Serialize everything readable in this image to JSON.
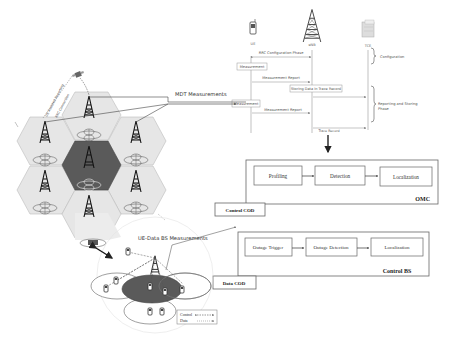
{
  "sequence": {
    "actors": {
      "ue": "UE",
      "enb": "eNB",
      "tce": "TCE"
    },
    "messages": {
      "rrc_config": "RRC Configuration Phase",
      "measurement_1": "Measurement",
      "report_1": "Measurement Report",
      "storing": "Storing Data in Trace Record",
      "measurement_2": "Measurement",
      "report_2": "Measurement Report",
      "trace_record": "Trace Record"
    },
    "phases": {
      "configuration": "Configuration",
      "reporting_line1": "Reporting and Storing",
      "reporting_line2": "Phase"
    }
  },
  "labels": {
    "mdt_measurements": "MDT Measurements",
    "ue_data_bs": "UE-Data BS Measurements",
    "ue_assisted": "UE Assisted Reporting",
    "rrc_connection": "RRC Connection"
  },
  "omc": {
    "title": "OMC",
    "steps": [
      "Profiling",
      "Detection",
      "Localization"
    ],
    "tag": "Control COD"
  },
  "control_bs": {
    "title": "Control BS",
    "steps": [
      "Outage Trigger",
      "Outage Detection",
      "Localization"
    ],
    "tag": "Data COD"
  },
  "legend": {
    "control": "Control",
    "data": "Data"
  },
  "colors": {
    "outage_cell": "#5a5a5a",
    "cell_fill": "#e4e4e4",
    "cell_stroke": "#b8b8b8",
    "line": "#333333"
  }
}
